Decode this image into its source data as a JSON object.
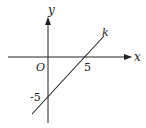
{
  "diagram": {
    "axes": {
      "x_label": "x",
      "y_label": "y",
      "origin_label": "O"
    },
    "line": {
      "name": "k",
      "x_intercept": 5,
      "y_intercept": -5,
      "equation": "y = x - 5"
    },
    "tick_labels": {
      "x_intercept_label": "5",
      "y_intercept_label": "-5"
    },
    "colors": {
      "stroke": "#222222",
      "background": "#ffffff"
    }
  }
}
